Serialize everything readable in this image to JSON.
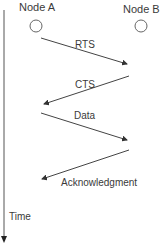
{
  "diagram": {
    "nodes": [
      {
        "label": "Node A"
      },
      {
        "label": "Node B"
      }
    ],
    "messages": [
      {
        "label": "RTS",
        "from": "Node A",
        "to": "Node B"
      },
      {
        "label": "CTS",
        "from": "Node B",
        "to": "Node A"
      },
      {
        "label": "Data",
        "from": "Node A",
        "to": "Node B"
      },
      {
        "label": "Acknowledgment",
        "from": "Node B",
        "to": "Node A"
      }
    ],
    "axis": {
      "label": "Time"
    },
    "colors": {
      "line": "#444444",
      "text": "#3a3a3a",
      "background": "#ffffff"
    }
  }
}
